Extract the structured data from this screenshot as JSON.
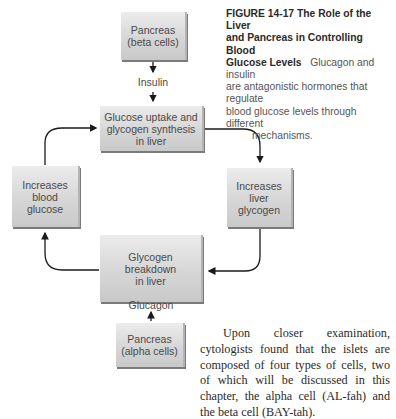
{
  "figure": {
    "caption": {
      "number": "FIGURE 14-17",
      "title": "The Role of the Liver and Pancreas in Controlling Blood Glucose Levels",
      "text_line1": "Glucagon and insulin",
      "text_line2": "are antagonistic hormones that regulate",
      "text_line3": "blood glucose levels through different",
      "text_line4": "mechanisms.",
      "title_line1": "The Role of the Liver",
      "title_line2": "and Pancreas in Controlling Blood",
      "title_line3": "Glucose Levels"
    },
    "nodes": {
      "pancreas_beta": "Pancreas\n(beta cells)",
      "glucose_uptake": "Glucose uptake and\nglycogen synthesis\nin liver",
      "increases_liver_glycogen": "Increases\nliver\nglycogen",
      "glycogen_breakdown": "Glycogen\nbreakdown\nin liver",
      "increases_blood_glucose": "Increases\nblood\nglucose",
      "pancreas_alpha": "Pancreas\n(alpha cells)"
    },
    "hormones": {
      "insulin": "Insulin",
      "glucagon": "Glucagon"
    },
    "colors": {
      "box_fill": "#d6d6d6",
      "arrow": "#1a1a1a",
      "text": "#4a4a4a"
    }
  },
  "body_text": "Upon closer examination, cytologists found that the islets are composed of four types of cells, two of which will be discussed in this chapter, the alpha cell (AL-fah) and the beta cell (BAY-tah)."
}
